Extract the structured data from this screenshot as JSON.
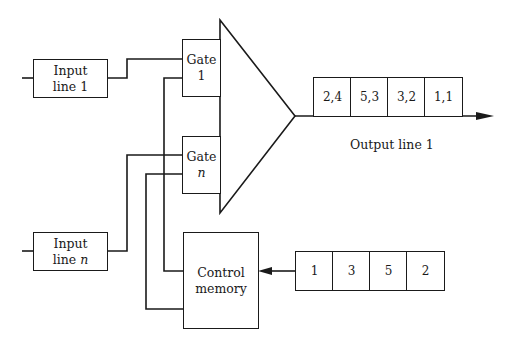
{
  "diagram": {
    "inputs": [
      {
        "line1": "Input",
        "line2": "line 1"
      },
      {
        "line1": "Input",
        "line2": "line",
        "var": "n"
      }
    ],
    "gates": [
      {
        "line1": "Gate",
        "line2": "1"
      },
      {
        "line1": "Gate",
        "line2": "n"
      }
    ],
    "control_memory": {
      "line1": "Control",
      "line2": "memory"
    },
    "output_queue": [
      "2,4",
      "5,3",
      "3,2",
      "1,1"
    ],
    "output_label": "Output line 1",
    "control_queue": [
      "1",
      "3",
      "5",
      "2"
    ]
  }
}
